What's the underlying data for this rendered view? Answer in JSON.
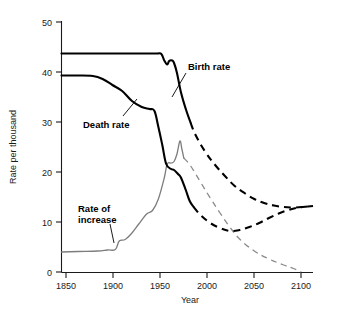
{
  "chart_data": {
    "type": "line",
    "title": "",
    "xlabel": "Year",
    "ylabel": "Rate per thousand",
    "xlim": [
      1843,
      2100
    ],
    "ylim": [
      0,
      50
    ],
    "xticks": [
      1850,
      1900,
      1950,
      2000,
      2050,
      2100
    ],
    "xtick_labels": [
      "1850",
      "1900",
      "1950",
      "2000",
      "2050",
      "2100"
    ],
    "yticks": [
      0,
      10,
      20,
      30,
      40,
      50
    ],
    "ytick_labels": [
      "0",
      "10",
      "20",
      "30",
      "40",
      "50"
    ],
    "grid": false,
    "legend_position": "inline-annotations",
    "series": [
      {
        "name": "Birth rate",
        "color": "#000000",
        "style_historical": "solid",
        "style_projected": "dashed",
        "projection_start_year": 1975,
        "x": [
          1843,
          1860,
          1880,
          1900,
          1920,
          1940,
          1945,
          1948,
          1951,
          1953,
          1956,
          1958,
          1961,
          1965,
          1970,
          1975,
          1980,
          1990,
          2000,
          2010,
          2020,
          2030,
          2040,
          2050,
          2060,
          2070,
          2080,
          2090,
          2100
        ],
        "values": [
          43.7,
          43.7,
          43.7,
          43.7,
          43.7,
          43.7,
          43.6,
          42.3,
          41.5,
          42.2,
          42.3,
          41.8,
          39.8,
          36.0,
          32.6,
          29.8,
          27.4,
          24.0,
          21.4,
          19.2,
          17.2,
          15.8,
          14.6,
          13.8,
          13.3,
          13.0,
          12.9,
          13.0,
          13.2
        ]
      },
      {
        "name": "Death rate",
        "color": "#000000",
        "style_historical": "solid",
        "style_projected": "dashed",
        "projection_start_year": 1978,
        "x": [
          1843,
          1860,
          1875,
          1885,
          1895,
          1905,
          1915,
          1925,
          1933,
          1938,
          1942,
          1946,
          1950,
          1955,
          1958,
          1962,
          1965,
          1970,
          1974,
          1978,
          1985,
          1995,
          2005,
          2015,
          2025,
          2035,
          2045,
          2055,
          2065,
          2075,
          2085,
          2095,
          2100
        ],
        "values": [
          39.3,
          39.3,
          39.2,
          38.6,
          37.4,
          36.2,
          34.2,
          33.0,
          32.6,
          32.2,
          29.0,
          25.4,
          21.6,
          20.6,
          20.4,
          19.6,
          18.9,
          16.4,
          14.2,
          13.0,
          11.4,
          9.8,
          8.8,
          8.2,
          8.4,
          9.0,
          9.8,
          10.8,
          11.7,
          12.4,
          12.9,
          13.1,
          13.2
        ]
      },
      {
        "name": "Rate of increase",
        "color": "#7d7d7d",
        "style_historical": "solid",
        "style_projected": "dashed",
        "projection_start_year": 1968,
        "x": [
          1843,
          1860,
          1880,
          1890,
          1898,
          1902,
          1908,
          1915,
          1922,
          1930,
          1936,
          1942,
          1948,
          1951,
          1955,
          1958,
          1961,
          1964,
          1966,
          1968,
          1975,
          1985,
          1995,
          2005,
          2015,
          2025,
          2040,
          2055,
          2070,
          2080,
          2088
        ],
        "values": [
          4.0,
          4.1,
          4.2,
          4.4,
          4.5,
          6.2,
          6.5,
          7.8,
          9.6,
          11.6,
          12.3,
          14.6,
          18.8,
          21.6,
          21.8,
          22.1,
          23.6,
          26.2,
          24.6,
          22.8,
          21.2,
          18.0,
          14.8,
          11.8,
          9.0,
          6.6,
          4.2,
          2.6,
          1.4,
          0.7,
          0.0
        ]
      }
    ],
    "annotations": [
      {
        "text": "Birth rate",
        "x": 1975,
        "y": 40.0
      },
      {
        "text": "Death rate",
        "x": 1888,
        "y": 27.5
      },
      {
        "text": "Rate of",
        "x": 1880,
        "y": 14.0
      },
      {
        "text": "increase",
        "x": 1880,
        "y": 11.6
      }
    ]
  }
}
